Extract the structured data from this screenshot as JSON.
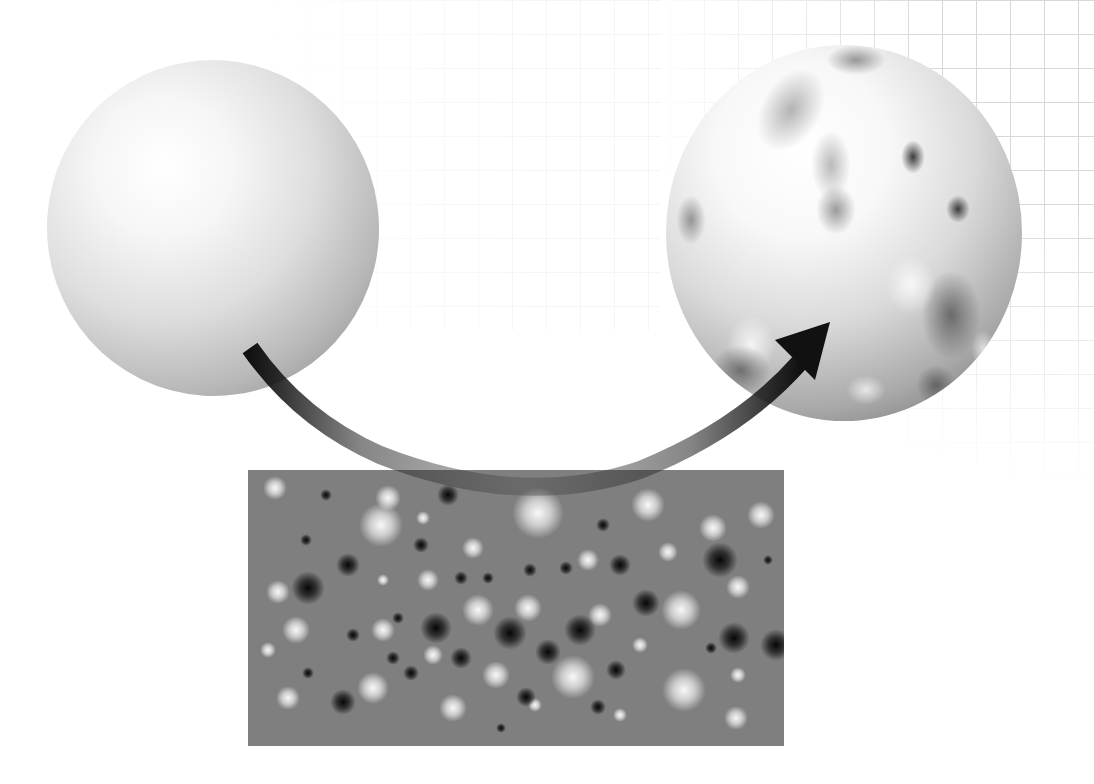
{
  "figure": {
    "type": "displacement-mapping-illustration",
    "elements": [
      {
        "name": "smooth-sphere",
        "description": "plain shaded sphere (input geometry)"
      },
      {
        "name": "displacement-texture",
        "description": "gray noise map with light and dark blurred spots"
      },
      {
        "name": "bumpy-sphere",
        "description": "sphere with displaced bumpy surface (output)"
      },
      {
        "name": "transform-arrow",
        "description": "curved arrow from smooth sphere through texture to bumpy sphere"
      }
    ]
  },
  "colors": {
    "background": "#ffffff",
    "grid_line": "#d4d4d4",
    "texture_base": "#7f7f7f",
    "arrow": "#111111"
  },
  "texture_spots": [
    {
      "x": 27,
      "y": 18,
      "r": 10,
      "c": "light"
    },
    {
      "x": 78,
      "y": 25,
      "r": 5,
      "c": "dark"
    },
    {
      "x": 133,
      "y": 55,
      "r": 18,
      "c": "light"
    },
    {
      "x": 58,
      "y": 70,
      "r": 5,
      "c": "dark"
    },
    {
      "x": 100,
      "y": 95,
      "r": 10,
      "c": "dark"
    },
    {
      "x": 60,
      "y": 118,
      "r": 14,
      "c": "dark"
    },
    {
      "x": 30,
      "y": 122,
      "r": 10,
      "c": "light"
    },
    {
      "x": 48,
      "y": 160,
      "r": 12,
      "c": "light"
    },
    {
      "x": 20,
      "y": 180,
      "r": 7,
      "c": "light"
    },
    {
      "x": 60,
      "y": 203,
      "r": 5,
      "c": "dark"
    },
    {
      "x": 40,
      "y": 228,
      "r": 10,
      "c": "light"
    },
    {
      "x": 95,
      "y": 232,
      "r": 11,
      "c": "dark"
    },
    {
      "x": 125,
      "y": 218,
      "r": 13,
      "c": "light"
    },
    {
      "x": 140,
      "y": 28,
      "r": 11,
      "c": "light"
    },
    {
      "x": 175,
      "y": 48,
      "r": 6,
      "c": "light"
    },
    {
      "x": 200,
      "y": 25,
      "r": 9,
      "c": "dark"
    },
    {
      "x": 225,
      "y": 78,
      "r": 9,
      "c": "light"
    },
    {
      "x": 173,
      "y": 75,
      "r": 7,
      "c": "dark"
    },
    {
      "x": 135,
      "y": 110,
      "r": 5,
      "c": "light"
    },
    {
      "x": 150,
      "y": 148,
      "r": 5,
      "c": "dark"
    },
    {
      "x": 180,
      "y": 110,
      "r": 9,
      "c": "light"
    },
    {
      "x": 213,
      "y": 108,
      "r": 6,
      "c": "dark"
    },
    {
      "x": 240,
      "y": 108,
      "r": 5,
      "c": "dark"
    },
    {
      "x": 188,
      "y": 158,
      "r": 13,
      "c": "dark"
    },
    {
      "x": 230,
      "y": 140,
      "r": 13,
      "c": "light"
    },
    {
      "x": 105,
      "y": 165,
      "r": 6,
      "c": "dark"
    },
    {
      "x": 135,
      "y": 160,
      "r": 10,
      "c": "light"
    },
    {
      "x": 145,
      "y": 188,
      "r": 6,
      "c": "dark"
    },
    {
      "x": 163,
      "y": 203,
      "r": 7,
      "c": "dark"
    },
    {
      "x": 185,
      "y": 185,
      "r": 8,
      "c": "light"
    },
    {
      "x": 213,
      "y": 188,
      "r": 9,
      "c": "dark"
    },
    {
      "x": 205,
      "y": 238,
      "r": 12,
      "c": "light"
    },
    {
      "x": 248,
      "y": 205,
      "r": 12,
      "c": "light"
    },
    {
      "x": 262,
      "y": 163,
      "r": 14,
      "c": "dark"
    },
    {
      "x": 290,
      "y": 43,
      "r": 22,
      "c": "light"
    },
    {
      "x": 280,
      "y": 138,
      "r": 12,
      "c": "light"
    },
    {
      "x": 282,
      "y": 100,
      "r": 6,
      "c": "dark"
    },
    {
      "x": 300,
      "y": 182,
      "r": 11,
      "c": "dark"
    },
    {
      "x": 318,
      "y": 98,
      "r": 6,
      "c": "dark"
    },
    {
      "x": 325,
      "y": 207,
      "r": 18,
      "c": "light"
    },
    {
      "x": 332,
      "y": 160,
      "r": 13,
      "c": "dark"
    },
    {
      "x": 340,
      "y": 90,
      "r": 9,
      "c": "light"
    },
    {
      "x": 355,
      "y": 55,
      "r": 6,
      "c": "dark"
    },
    {
      "x": 352,
      "y": 145,
      "r": 10,
      "c": "light"
    },
    {
      "x": 372,
      "y": 95,
      "r": 9,
      "c": "dark"
    },
    {
      "x": 368,
      "y": 200,
      "r": 8,
      "c": "dark"
    },
    {
      "x": 372,
      "y": 245,
      "r": 6,
      "c": "light"
    },
    {
      "x": 398,
      "y": 133,
      "r": 12,
      "c": "dark"
    },
    {
      "x": 392,
      "y": 175,
      "r": 7,
      "c": "light"
    },
    {
      "x": 400,
      "y": 35,
      "r": 14,
      "c": "light"
    },
    {
      "x": 420,
      "y": 82,
      "r": 8,
      "c": "light"
    },
    {
      "x": 350,
      "y": 237,
      "r": 7,
      "c": "dark"
    },
    {
      "x": 287,
      "y": 235,
      "r": 6,
      "c": "light"
    },
    {
      "x": 253,
      "y": 258,
      "r": 4,
      "c": "dark"
    },
    {
      "x": 278,
      "y": 227,
      "r": 8,
      "c": "dark"
    },
    {
      "x": 433,
      "y": 140,
      "r": 17,
      "c": "light"
    },
    {
      "x": 436,
      "y": 220,
      "r": 18,
      "c": "light"
    },
    {
      "x": 465,
      "y": 58,
      "r": 12,
      "c": "light"
    },
    {
      "x": 472,
      "y": 90,
      "r": 15,
      "c": "dark"
    },
    {
      "x": 463,
      "y": 178,
      "r": 5,
      "c": "dark"
    },
    {
      "x": 490,
      "y": 117,
      "r": 10,
      "c": "light"
    },
    {
      "x": 486,
      "y": 168,
      "r": 13,
      "c": "dark"
    },
    {
      "x": 490,
      "y": 205,
      "r": 7,
      "c": "light"
    },
    {
      "x": 488,
      "y": 248,
      "r": 10,
      "c": "light"
    },
    {
      "x": 513,
      "y": 45,
      "r": 12,
      "c": "light"
    },
    {
      "x": 520,
      "y": 90,
      "r": 4,
      "c": "dark"
    },
    {
      "x": 528,
      "y": 175,
      "r": 13,
      "c": "dark"
    }
  ]
}
